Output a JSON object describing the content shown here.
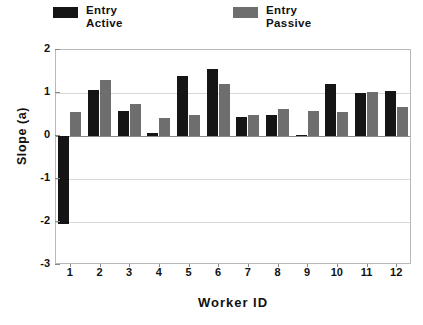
{
  "chart_data": {
    "type": "bar",
    "title": "",
    "xlabel": "Worker  ID",
    "ylabel": "Slope  (a)",
    "categories": [
      "1",
      "2",
      "3",
      "4",
      "5",
      "6",
      "7",
      "8",
      "9",
      "10",
      "11",
      "12"
    ],
    "series": [
      {
        "name": "Entry Active",
        "color": "#151515",
        "values": [
          -2.05,
          1.08,
          0.58,
          0.08,
          1.4,
          1.55,
          0.45,
          0.48,
          0.03,
          1.2,
          1.0,
          1.05
        ]
      },
      {
        "name": "Entry Passive",
        "color": "#6e6e6e",
        "values": [
          0.55,
          1.3,
          0.75,
          0.42,
          0.5,
          1.22,
          0.48,
          0.62,
          0.58,
          0.55,
          1.02,
          0.68
        ]
      }
    ],
    "ylim": [
      -3,
      2
    ],
    "yticks": [
      2,
      1,
      0,
      -1,
      -2,
      -3
    ],
    "ytick_labels": [
      "2",
      "1",
      "0",
      "-1",
      "-2",
      "-3"
    ],
    "grid": true,
    "legend_position": "top"
  },
  "legend": {
    "entries": [
      {
        "line1": "Entry",
        "line2": "Active",
        "color": "#151515"
      },
      {
        "line1": "Entry",
        "line2": "Passive",
        "color": "#6e6e6e"
      }
    ]
  },
  "axes": {
    "y_title": "Slope  (a)",
    "x_title": "Worker  ID"
  }
}
